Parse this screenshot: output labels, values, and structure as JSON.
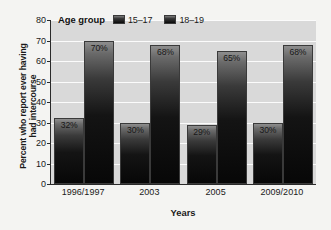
{
  "chart_data": {
    "type": "bar",
    "title": "",
    "xlabel": "Years",
    "ylabel": "Percent who report ever having had intercourse",
    "categories": [
      "1996/1997",
      "2003",
      "2005",
      "2009/2010"
    ],
    "series": [
      {
        "name": "15–17",
        "values": [
          32,
          30,
          29,
          30
        ],
        "data_labels": [
          "32%",
          "30%",
          "29%",
          "30%"
        ]
      },
      {
        "name": "18–19",
        "values": [
          70,
          68,
          65,
          68
        ],
        "data_labels": [
          "70%",
          "68%",
          "65%",
          "68%"
        ]
      }
    ],
    "ylim": [
      0,
      80
    ],
    "yticks": [
      0,
      10,
      20,
      30,
      40,
      50,
      60,
      70,
      80
    ],
    "ytick_labels": [
      "0",
      "10",
      "20",
      "30",
      "40",
      "50",
      "60",
      "70",
      "80"
    ],
    "grid": true,
    "legend_position": "top-left-inside",
    "legend_title": "Age group",
    "colors": {
      "plot_background": "#d9d9d9",
      "page_background": "#f4f4f2",
      "gridline": "#fbfbfb",
      "axis": "#2a2a2a",
      "bar_gradient_top": "#8e8e8e",
      "bar_gradient_bottom": "#070707",
      "text": "#1a1a1a"
    }
  },
  "axis": {
    "y_title_line1": "Percent who report ever having",
    "y_title_line2": "had intercourse",
    "x_title": "Years"
  },
  "legend": {
    "title": "Age group",
    "items": [
      {
        "label": "15–17"
      },
      {
        "label": "18–19"
      }
    ]
  }
}
